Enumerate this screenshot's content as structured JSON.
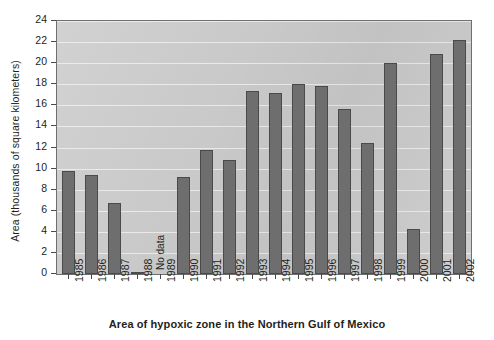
{
  "chart_data": {
    "type": "bar",
    "title": "",
    "caption": "Area of hypoxic zone in the Northern Gulf of Mexico",
    "xlabel": "",
    "ylabel": "Area (thousands of square kilometers)",
    "ylim": [
      0,
      24
    ],
    "ytick_step": 2,
    "yticks": [
      "0",
      "2",
      "4",
      "6",
      "8",
      "10",
      "12",
      "14",
      "16",
      "18",
      "20",
      "22",
      "24"
    ],
    "grid": true,
    "legend": "none",
    "categories": [
      "1985",
      "1986",
      "1987",
      "1988",
      "1989",
      "1990",
      "1991",
      "1992",
      "1993",
      "1994",
      "1995",
      "1996",
      "1997",
      "1998",
      "1999",
      "2000",
      "2001",
      "2002"
    ],
    "values": [
      9.8,
      9.4,
      6.7,
      0.15,
      null,
      9.2,
      11.8,
      10.8,
      17.4,
      17.2,
      18.0,
      17.8,
      15.7,
      12.4,
      20.0,
      4.3,
      20.9,
      22.2
    ],
    "annotations": [
      {
        "text": "No data",
        "category": "1989"
      }
    ],
    "colors": {
      "bar_fill": "#6e6e6e",
      "bar_stroke": "#4a4a4a",
      "panel_background": "#c9c9c9",
      "gridline": "#efefef",
      "axis": "#4a4a4a",
      "text": "#231f20",
      "page_background": "#ffffff"
    }
  }
}
